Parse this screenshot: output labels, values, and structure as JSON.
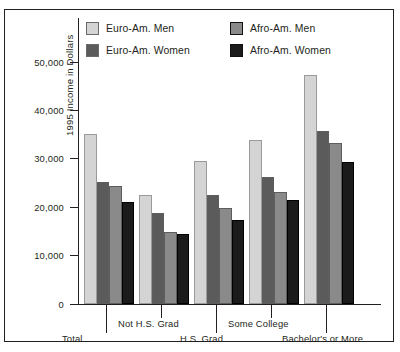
{
  "chart_data": {
    "type": "bar",
    "title": "",
    "subtitle": "",
    "xlabel": "",
    "ylabel": "1995 Income in Dollars",
    "ylim": [
      0,
      55000
    ],
    "yticks": [
      0,
      10000,
      20000,
      30000,
      40000,
      50000
    ],
    "ytick_labels": [
      "0",
      "10,000",
      "20,000",
      "30,000",
      "40,000",
      "50,000"
    ],
    "grid": false,
    "legend_position": "top-inside",
    "categories": [
      "Total",
      "Not H.S. Grad",
      "H.S. Grad",
      "Some College",
      "Bachelor's or More"
    ],
    "series": [
      {
        "name": "Euro-Am. Men",
        "color": "#d4d4d4",
        "values": [
          35100,
          22500,
          29600,
          33900,
          47300
        ]
      },
      {
        "name": "Euro-Am. Women",
        "color": "#5b5b5b",
        "values": [
          25200,
          18800,
          22500,
          26200,
          35700
        ]
      },
      {
        "name": "Afro-Am. Men",
        "color": "#8a8a8a",
        "values": [
          24400,
          14900,
          19800,
          23100,
          33200
        ]
      },
      {
        "name": "Afro-Am. Women",
        "color": "#1b1b1b",
        "values": [
          21100,
          14500,
          17400,
          21500,
          29300
        ]
      }
    ]
  },
  "legend": {
    "items": [
      {
        "label": "Euro-Am. Men"
      },
      {
        "label": "Euro-Am. Women"
      },
      {
        "label": "Afro-Am. Men"
      },
      {
        "label": "Afro-Am. Women"
      }
    ]
  }
}
